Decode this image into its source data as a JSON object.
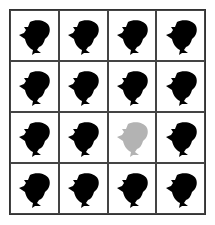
{
  "puzzle": {
    "rows": 4,
    "cols": 4,
    "cells": [
      {
        "icon": "dolphin-icon",
        "color": "#000000"
      },
      {
        "icon": "dolphin-icon",
        "color": "#000000"
      },
      {
        "icon": "dolphin-icon",
        "color": "#000000"
      },
      {
        "icon": "dolphin-icon",
        "color": "#000000"
      },
      {
        "icon": "dolphin-icon",
        "color": "#000000"
      },
      {
        "icon": "dolphin-icon",
        "color": "#000000"
      },
      {
        "icon": "dolphin-icon",
        "color": "#000000"
      },
      {
        "icon": "dolphin-icon",
        "color": "#000000"
      },
      {
        "icon": "dolphin-icon",
        "color": "#000000"
      },
      {
        "icon": "dolphin-icon",
        "color": "#000000"
      },
      {
        "icon": "dolphin-icon",
        "color": "#b3b3b3"
      },
      {
        "icon": "dolphin-icon",
        "color": "#000000"
      },
      {
        "icon": "dolphin-icon",
        "color": "#000000"
      },
      {
        "icon": "dolphin-icon",
        "color": "#000000"
      },
      {
        "icon": "dolphin-icon",
        "color": "#000000"
      },
      {
        "icon": "dolphin-icon",
        "color": "#000000"
      }
    ]
  }
}
